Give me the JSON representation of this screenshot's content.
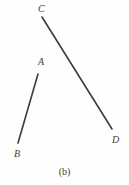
{
  "figure": {
    "caption": "(b)",
    "background_color": "#fefefe",
    "stroke_color": "#3b3b3b",
    "label_color": "#3b3b3b",
    "width": 129,
    "height": 185,
    "segments": [
      {
        "name": "segment-CD",
        "from_label": "C",
        "to_label": "D",
        "x1": 42,
        "y1": 17,
        "x2": 112,
        "y2": 129,
        "stroke_width": 1.6
      },
      {
        "name": "segment-AB",
        "from_label": "A",
        "to_label": "B",
        "x1": 38,
        "y1": 74,
        "x2": 18,
        "y2": 143,
        "stroke_width": 1.6
      }
    ],
    "labels": [
      {
        "name": "label-C",
        "text": "C",
        "x": 38,
        "y": 4
      },
      {
        "name": "label-A",
        "text": "A",
        "x": 38,
        "y": 57
      },
      {
        "name": "label-B",
        "text": "B",
        "x": 14,
        "y": 149
      },
      {
        "name": "label-D",
        "text": "D",
        "x": 112,
        "y": 135
      }
    ]
  }
}
